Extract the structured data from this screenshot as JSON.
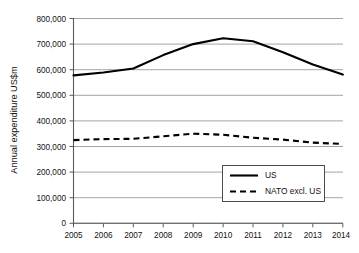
{
  "chart_data": {
    "type": "line",
    "title": "",
    "subtitle": "",
    "xlabel": "",
    "ylabel": "Annual expenditure US$m",
    "x": [
      2005,
      2006,
      2007,
      2008,
      2009,
      2010,
      2011,
      2012,
      2013,
      2014
    ],
    "categories": [
      "2005",
      "2006",
      "2007",
      "2008",
      "2009",
      "2010",
      "2011",
      "2012",
      "2013",
      "2014"
    ],
    "series": [
      {
        "name": "US",
        "style": "solid",
        "color": "#000000",
        "values": [
          578000,
          589000,
          605000,
          657000,
          700000,
          723000,
          711000,
          668000,
          620000,
          581000
        ]
      },
      {
        "name": "NATO excl. US",
        "style": "dashed",
        "color": "#000000",
        "values": [
          325000,
          329000,
          330000,
          340000,
          350000,
          346000,
          334000,
          327000,
          315000,
          310000
        ]
      }
    ],
    "ylim": [
      0,
      800000
    ],
    "xlim": [
      2005,
      2014
    ],
    "yticks": [
      0,
      100000,
      200000,
      300000,
      400000,
      500000,
      600000,
      700000,
      800000
    ],
    "ytick_labels": [
      "0",
      "100,000",
      "200,000",
      "300,000",
      "400,000",
      "500,000",
      "600,000",
      "700,000",
      "800,000"
    ],
    "xtick_labels": [
      "2005",
      "2006",
      "2007",
      "2008",
      "2009",
      "2010",
      "2011",
      "2012",
      "2013",
      "2014"
    ],
    "grid": "horizontal",
    "legend_position": "inside-bottom-right",
    "legend_entries": [
      "US",
      "NATO excl. US"
    ],
    "annotations": []
  }
}
